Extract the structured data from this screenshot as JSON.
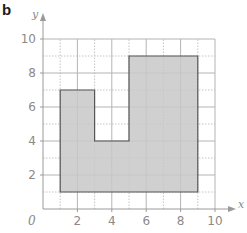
{
  "panel": {
    "label": "b"
  },
  "chart_data": {
    "type": "diagram",
    "title": "",
    "xlabel": "x",
    "ylabel": "y",
    "xlim": [
      0,
      10
    ],
    "ylim": [
      0,
      10
    ],
    "origin_label": "0",
    "x_ticks": [
      "2",
      "4",
      "6",
      "8",
      "10"
    ],
    "y_ticks": [
      "2",
      "4",
      "6",
      "8",
      "10"
    ],
    "grid": {
      "major_every": 2,
      "minor_every": 1,
      "minor_style": "dotted"
    },
    "shape": {
      "name": "shaded rectilinear polygon",
      "fill": "#c8c8c8",
      "stroke": "#555555",
      "vertices": [
        [
          1,
          1
        ],
        [
          1,
          7
        ],
        [
          3,
          7
        ],
        [
          3,
          4
        ],
        [
          5,
          4
        ],
        [
          5,
          9
        ],
        [
          9,
          9
        ],
        [
          9,
          1
        ]
      ]
    }
  },
  "colors": {
    "axis": "#9a9a9a",
    "grid_major": "#b4b4b4",
    "grid_minor": "#c4c4c4",
    "shape_fill": "#c8c8c8",
    "shape_stroke": "#555555"
  }
}
